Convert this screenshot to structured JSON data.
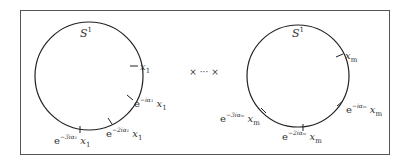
{
  "diagram": {
    "operator": "× ··· ×",
    "left_circle": {
      "name": "S",
      "name_sup": "1",
      "points": [
        {
          "base": "",
          "exp": "",
          "var": "x",
          "sub": "1"
        },
        {
          "base": "e",
          "exp": "−iα₁",
          "var": "x",
          "sub": "1"
        },
        {
          "base": "e",
          "exp": "−2iα₁",
          "var": "x",
          "sub": "1"
        },
        {
          "base": "e",
          "exp": "−3iα₁",
          "var": "x",
          "sub": "1"
        }
      ]
    },
    "right_circle": {
      "name": "S",
      "name_sup": "1",
      "points": [
        {
          "base": "",
          "exp": "",
          "var": "x",
          "sub": "m"
        },
        {
          "base": "e",
          "exp": "−iαₘ",
          "var": "x",
          "sub": "m"
        },
        {
          "base": "e",
          "exp": "−2iαₘ",
          "var": "x",
          "sub": "m"
        },
        {
          "base": "e",
          "exp": "−3iαₘ",
          "var": "x",
          "sub": "m"
        }
      ]
    }
  }
}
